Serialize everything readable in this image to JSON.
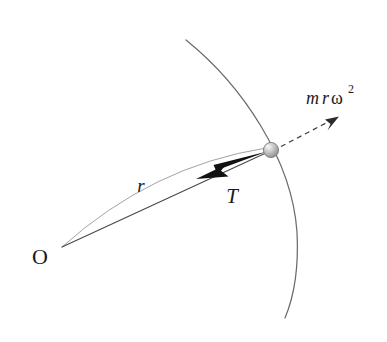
{
  "figure": {
    "background_color": "#ffffff",
    "width": 387,
    "height": 342
  },
  "labels": {
    "origin": "O",
    "radius": "r",
    "tension": "T",
    "centrifugal_m": "m",
    "centrifugal_r": "r",
    "centrifugal_omega": "ω",
    "centrifugal_exponent": "2",
    "centrifugal_full": "mrω²"
  },
  "colors": {
    "stroke_dark": "#2b2b2b",
    "stroke_thin": "#6b6b6b",
    "stroke_faint": "#9a9a9a",
    "arrow_solid": "#111111",
    "bead_fill": "#b9b9b9",
    "bead_edge": "#7d7d7d",
    "bead_highlight": "#e8e8e8",
    "text": "#1a1a1a"
  },
  "geometry": {
    "origin_point": {
      "x": 62,
      "y": 247
    },
    "bead_point": {
      "x": 271,
      "y": 150
    },
    "bead_radius": 7.5,
    "circle_arc": {
      "start": {
        "x": 186,
        "y": 40
      },
      "end": {
        "x": 285,
        "y": 318
      },
      "bulge_x": 298
    },
    "tension_arrow": {
      "tail": {
        "x": 266,
        "y": 153
      },
      "tip": {
        "x": 196,
        "y": 179
      }
    },
    "centrifugal_arrow": {
      "tail": {
        "x": 281,
        "y": 146
      },
      "tip": {
        "x": 338,
        "y": 117
      },
      "dash_pattern": "5,4"
    },
    "radius_arc": {
      "start": {
        "x": 62,
        "y": 247
      },
      "end": {
        "x": 266,
        "y": 149
      },
      "control": {
        "x": 150,
        "y": 168
      }
    },
    "radius_line": {
      "start": {
        "x": 62,
        "y": 247
      },
      "end": {
        "x": 267,
        "y": 152
      }
    }
  },
  "label_positions": {
    "origin": {
      "x": 40,
      "y": 264
    },
    "radius": {
      "x": 141,
      "y": 192
    },
    "tension": {
      "x": 232,
      "y": 203
    },
    "centrifugal": {
      "x": 306,
      "y": 104
    }
  }
}
